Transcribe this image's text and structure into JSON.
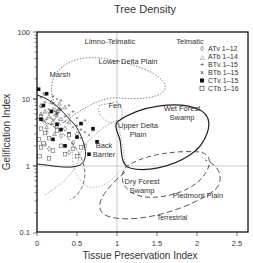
{
  "chart_data": {
    "type": "scatter",
    "title": "Tree Density",
    "xlabel": "Tissue Preservation Index",
    "ylabel": "Gelification Index",
    "xlim": [
      0,
      2.5
    ],
    "ylim": [
      0.1,
      100
    ],
    "yscale": "log",
    "x_ticks": [
      "0",
      "0.5",
      "1",
      "1.5",
      "2",
      "2.5"
    ],
    "y_ticks": [
      "0.1",
      "1",
      "10",
      "100"
    ],
    "grid": false,
    "reference_lines": {
      "x": 1,
      "y": 1
    },
    "legend_position": "upper right",
    "legend": [
      {
        "label": "ATv 1–12",
        "marker": "diamond-open"
      },
      {
        "label": "ATb 1–14",
        "marker": "triangle-open"
      },
      {
        "label": "BTv 1–15",
        "marker": "plus"
      },
      {
        "label": "BTb 1–15",
        "marker": "x"
      },
      {
        "label": "CTv 1–15",
        "marker": "square-filled"
      },
      {
        "label": "CTb 1–16",
        "marker": "square-open"
      }
    ],
    "annotations": [
      "Limno-Telmatic",
      "Telmatic",
      "Lower Delta Plain",
      "Marsh",
      "Lake",
      "Fen",
      "Upper Delta Plain",
      "Wet Forest Swamp",
      "Back Barrier",
      "Dry Forest Swamp",
      "Piedmont Plain",
      "Terrestrial"
    ],
    "series": [
      {
        "name": "ATv 1–12",
        "points": [
          [
            0.05,
            5.5
          ],
          [
            0.12,
            3.2
          ],
          [
            0.3,
            2.8
          ],
          [
            0.45,
            2.2
          ],
          [
            0.6,
            2.0
          ],
          [
            0.2,
            4.5
          ],
          [
            0.35,
            3.6
          ],
          [
            0.1,
            2.1
          ],
          [
            0.5,
            3.0
          ],
          [
            0.25,
            6.5
          ],
          [
            0.15,
            1.8
          ],
          [
            0.4,
            1.6
          ]
        ]
      },
      {
        "name": "ATb 1–14",
        "points": [
          [
            0.05,
            8.0
          ],
          [
            0.1,
            6.5
          ],
          [
            0.15,
            5.5
          ],
          [
            0.2,
            7.0
          ],
          [
            0.08,
            4.8
          ],
          [
            0.3,
            5.0
          ],
          [
            0.25,
            4.0
          ],
          [
            0.12,
            3.8
          ],
          [
            0.35,
            7.5
          ],
          [
            0.18,
            9.0
          ],
          [
            0.4,
            4.5
          ],
          [
            0.05,
            6.0
          ],
          [
            0.22,
            3.0
          ],
          [
            0.28,
            8.5
          ]
        ]
      },
      {
        "name": "BTv 1–15",
        "points": [
          [
            0.05,
            10.5
          ],
          [
            0.1,
            9.0
          ],
          [
            0.15,
            7.0
          ],
          [
            0.2,
            11.0
          ],
          [
            0.3,
            9.5
          ],
          [
            0.25,
            6.0
          ],
          [
            0.35,
            5.5
          ],
          [
            0.4,
            8.0
          ],
          [
            0.12,
            5.0
          ],
          [
            0.45,
            6.5
          ],
          [
            0.5,
            4.0
          ],
          [
            0.08,
            12.0
          ],
          [
            0.55,
            3.5
          ],
          [
            0.18,
            4.2
          ],
          [
            0.6,
            4.8
          ]
        ]
      },
      {
        "name": "BTb 1–15",
        "points": [
          [
            0.05,
            7.5
          ],
          [
            0.1,
            11.5
          ],
          [
            0.2,
            8.5
          ],
          [
            0.3,
            7.2
          ],
          [
            0.15,
            6.2
          ],
          [
            0.4,
            5.8
          ],
          [
            0.25,
            10.0
          ],
          [
            0.35,
            4.6
          ],
          [
            0.5,
            5.2
          ],
          [
            0.45,
            3.8
          ],
          [
            0.6,
            3.2
          ],
          [
            0.12,
            4.3
          ],
          [
            0.55,
            2.6
          ],
          [
            0.65,
            2.9
          ],
          [
            0.7,
            3.4
          ]
        ]
      },
      {
        "name": "CTv 1–15",
        "points": [
          [
            0.02,
            14.0
          ],
          [
            0.12,
            12.0
          ],
          [
            0.08,
            8.0
          ],
          [
            0.18,
            6.5
          ],
          [
            0.25,
            4.2
          ],
          [
            0.05,
            5.0
          ],
          [
            0.3,
            3.5
          ],
          [
            0.4,
            3.0
          ],
          [
            0.5,
            2.7
          ],
          [
            0.55,
            4.3
          ],
          [
            0.7,
            3.6
          ],
          [
            0.75,
            2.3
          ],
          [
            0.65,
            1.5
          ],
          [
            0.2,
            2.5
          ],
          [
            0.35,
            2.0
          ]
        ]
      },
      {
        "name": "CTb 1–16",
        "points": [
          [
            0.02,
            2.5
          ],
          [
            0.03,
            1.4
          ],
          [
            0.05,
            1.9
          ],
          [
            0.1,
            3.1
          ],
          [
            0.08,
            2.2
          ],
          [
            0.15,
            2.6
          ],
          [
            0.2,
            1.7
          ],
          [
            0.25,
            3.4
          ],
          [
            0.3,
            2.0
          ],
          [
            0.35,
            1.5
          ],
          [
            0.4,
            2.9
          ],
          [
            0.45,
            1.8
          ],
          [
            0.5,
            1.4
          ],
          [
            0.15,
            1.3
          ],
          [
            0.55,
            1.9
          ],
          [
            0.05,
            3.6
          ]
        ]
      }
    ]
  },
  "labels": {
    "title": "Tree Density",
    "xlabel": "Tissue Preservation Index",
    "ylabel": "Gelification Index",
    "xticks": [
      "0",
      "0.5",
      "1",
      "1.5",
      "2",
      "2.5"
    ],
    "yticks": [
      "0.1",
      "1",
      "10",
      "100"
    ],
    "regions": {
      "limno": "Limno-Telmatic",
      "telmatic": "Telmatic",
      "ldp": "Lower Delta Plain",
      "marsh": "Marsh",
      "lake": "Lake",
      "fen": "Fen",
      "udp1": "Upper Delta",
      "udp2": "Plain",
      "wfs1": "Wet Forest",
      "wfs2": "Swamp",
      "bb1": "Back",
      "bb2": "Barrier",
      "dfs1": "Dry Forest",
      "dfs2": "Swamp",
      "piedmont": "Piedmont Plain",
      "terrestrial": "Terrestrial"
    },
    "legend": [
      "ATv 1–12",
      "ATb 1–14",
      "BTv 1–15",
      "BTb 1–15",
      "CTv 1–15",
      "CTb 1–16"
    ]
  }
}
